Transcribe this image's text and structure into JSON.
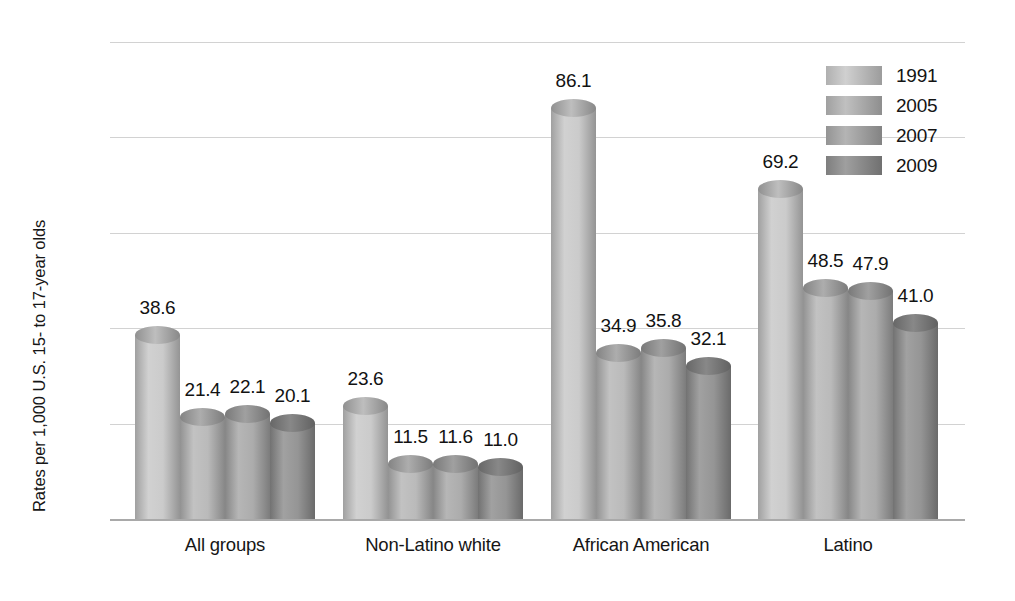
{
  "chart_data": {
    "type": "bar",
    "title": "",
    "subtitle": "",
    "xlabel": "",
    "ylabel": "Rates per 1,000 U.S. 15- to 17-year olds",
    "ylim": [
      0,
      100
    ],
    "yticks": [
      100,
      80,
      60,
      40,
      20,
      0
    ],
    "grid": true,
    "legend_position": "top-right",
    "categories": [
      "All groups",
      "Non-Latino white",
      "African American",
      "Latino"
    ],
    "series": [
      {
        "name": "1991",
        "values": [
          38.6,
          23.6,
          86.1,
          69.2
        ],
        "color": "#c8c8c8"
      },
      {
        "name": "2005",
        "values": [
          21.4,
          11.5,
          34.9,
          48.5
        ],
        "color": "#b6b6b6"
      },
      {
        "name": "2007",
        "values": [
          22.1,
          11.6,
          35.8,
          47.9
        ],
        "color": "#a8a8a8"
      },
      {
        "name": "2009",
        "values": [
          20.1,
          11.0,
          32.1,
          41.0
        ],
        "color": "#8f8f8f"
      }
    ],
    "data_labels": [
      [
        "38.6",
        "21.4",
        "22.1",
        "20.1"
      ],
      [
        "23.6",
        "11.5",
        "11.6",
        "11.0"
      ],
      [
        "86.1",
        "34.9",
        "35.8",
        "32.1"
      ],
      [
        "69.2",
        "48.5",
        "47.9",
        "41.0"
      ]
    ],
    "axis_color": "#a9a9a9",
    "gridline_color": "#d2d2d2",
    "background_color": "#ffffff",
    "text_color": "#161616"
  },
  "legend": {
    "items": [
      {
        "label": "1991"
      },
      {
        "label": "2005"
      },
      {
        "label": "2007"
      },
      {
        "label": "2009"
      }
    ]
  }
}
